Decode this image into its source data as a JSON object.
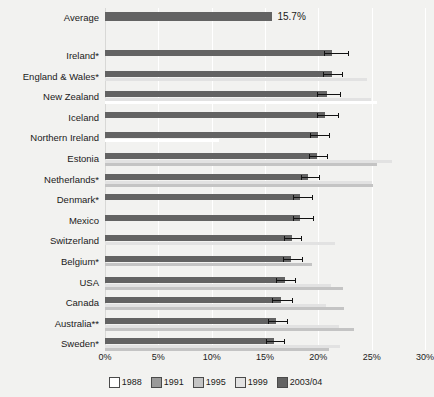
{
  "chart_data": {
    "type": "bar",
    "title": "",
    "xlabel": "",
    "ylabel": "",
    "xlim": [
      0,
      30
    ],
    "xticks": [
      "0%",
      "5%",
      "10%",
      "15%",
      "20%",
      "25%",
      "30%"
    ],
    "grid": true,
    "orientation": "horizontal",
    "legend_position": "bottom",
    "series_order": [
      "1988",
      "1991",
      "1995",
      "1999",
      "2003/04"
    ],
    "series_colors": {
      "1988": "#ffffff",
      "1991": "#9a9a9a",
      "1995": "#c4c4c4",
      "1999": "#e2e2e2",
      "2003/04": "#636363"
    },
    "average": {
      "label": "Average",
      "value": 15.7,
      "value_label": "15.7%"
    },
    "categories": [
      "Ireland*",
      "England & Wales*",
      "New Zealand",
      "Iceland",
      "Northern Ireland",
      "Estonia",
      "Netherlands*",
      "Denmark*",
      "Mexico",
      "Switzerland",
      "Belgium*",
      "USA",
      "Canada",
      "Australia**",
      "Sweden*"
    ],
    "rows": [
      {
        "category": "Ireland*",
        "v2003": 21.3,
        "err_low": 20.5,
        "err_high": 22.8,
        "v1999": null,
        "v1995": null,
        "v1991": null,
        "v1988": null
      },
      {
        "category": "England & Wales*",
        "v2003": 21.3,
        "err_low": 20.4,
        "err_high": 22.2,
        "v1999": 24.6,
        "v1995": null,
        "v1991": null,
        "v1988": null
      },
      {
        "category": "New Zealand",
        "v2003": 20.8,
        "err_low": 19.9,
        "err_high": 22.0,
        "v1999": 24.9,
        "v1995": null,
        "v1991": null,
        "v1988": 25.5
      },
      {
        "category": "Iceland",
        "v2003": 20.6,
        "err_low": 19.9,
        "err_high": 21.8,
        "v1999": null,
        "v1995": null,
        "v1991": null,
        "v1988": null
      },
      {
        "category": "Northern Ireland",
        "v2003": 20.0,
        "err_low": 19.2,
        "err_high": 21.0,
        "v1999": null,
        "v1995": null,
        "v1991": null,
        "v1988": 10.7
      },
      {
        "category": "Estonia",
        "v2003": 19.9,
        "err_low": 19.1,
        "err_high": 20.8,
        "v1995": 25.5,
        "v1999": 26.9,
        "v1991": null,
        "v1988": null
      },
      {
        "category": "Netherlands*",
        "v2003": 19.0,
        "err_low": 18.4,
        "err_high": 20.1,
        "v1995": 25.1,
        "v1999": 25.0,
        "v1991": null,
        "v1988": null
      },
      {
        "category": "Denmark*",
        "v2003": 18.3,
        "err_low": 17.6,
        "err_high": 19.4,
        "v1999": null,
        "v1995": null,
        "v1991": null,
        "v1988": null
      },
      {
        "category": "Mexico",
        "v2003": 18.3,
        "err_low": 17.6,
        "err_high": 19.5,
        "v1999": null,
        "v1995": null,
        "v1991": null,
        "v1988": null
      },
      {
        "category": "Switzerland",
        "v2003": 17.5,
        "err_low": 16.8,
        "err_high": 18.4,
        "v1999": 21.6,
        "v1995": null,
        "v1991": null,
        "v1988": null
      },
      {
        "category": "Belgium*",
        "v2003": 17.4,
        "err_low": 16.7,
        "err_high": 18.5,
        "v1999": null,
        "v1995": 19.4,
        "v1991": null,
        "v1988": null
      },
      {
        "category": "USA",
        "v2003": 16.9,
        "err_low": 16.0,
        "err_high": 17.8,
        "v1999": 21.2,
        "v1995": 22.3,
        "v1991": null,
        "v1988": null
      },
      {
        "category": "Canada",
        "v2003": 16.5,
        "err_low": 15.7,
        "err_high": 17.5,
        "v1999": 20.7,
        "v1995": 22.4,
        "v1991": null,
        "v1988": null
      },
      {
        "category": "Australia**",
        "v2003": 16.0,
        "err_low": 15.3,
        "err_high": 17.1,
        "v1999": 21.9,
        "v1995": 23.3,
        "v1991": null,
        "v1988": null
      },
      {
        "category": "Sweden*",
        "v2003": 15.8,
        "err_low": 15.1,
        "err_high": 16.8,
        "v1999": 22.0,
        "v1995": 21.0,
        "v1991": null,
        "v1988": null
      }
    ]
  },
  "legend": {
    "items": [
      {
        "label": "1988",
        "color": "#ffffff"
      },
      {
        "label": "1991",
        "color": "#9a9a9a"
      },
      {
        "label": "1995",
        "color": "#c4c4c4"
      },
      {
        "label": "1999",
        "color": "#e2e2e2"
      },
      {
        "label": "2003/04",
        "color": "#636363"
      }
    ]
  }
}
